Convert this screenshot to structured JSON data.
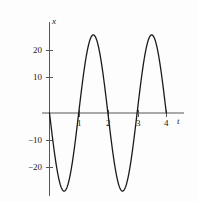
{
  "figure": {
    "background_color": "#fdfdfd",
    "curve_color": "#1a1a1a",
    "axis_color": "#4d4d4d"
  },
  "axes": {
    "x_axis_name": "t",
    "y_axis_name": "x"
  },
  "chart_data": {
    "type": "line",
    "title": "",
    "xlabel": "t",
    "ylabel": "x",
    "xlim": [
      -0.15,
      4.45
    ],
    "ylim": [
      -28,
      30
    ],
    "grid": false,
    "legend": null,
    "x_ticks": [
      1,
      2,
      3,
      4
    ],
    "x_tick_labels": [
      "1",
      "2",
      "3",
      "4"
    ],
    "y_ticks": [
      20,
      10,
      -10,
      -20
    ],
    "y_tick_labels": [
      "20",
      "10",
      "−10",
      "−20"
    ],
    "series": [
      {
        "name": "x(t)",
        "description": "sinusoid, amplitude 25, period 2, starts at origin descending",
        "amplitude": 25,
        "period": 2,
        "phase": "negative-sine",
        "domain": [
          0,
          4
        ],
        "x": [
          0,
          0.1,
          0.2,
          0.3,
          0.4,
          0.5,
          0.6,
          0.7,
          0.8,
          0.9,
          1.0,
          1.1,
          1.2,
          1.3,
          1.4,
          1.5,
          1.6,
          1.7,
          1.8,
          1.9,
          2.0,
          2.1,
          2.2,
          2.3,
          2.4,
          2.5,
          2.6,
          2.7,
          2.8,
          2.9,
          3.0,
          3.1,
          3.2,
          3.3,
          3.4,
          3.5,
          3.6,
          3.7,
          3.8,
          3.9,
          4.0
        ],
        "values": [
          0,
          -7.7,
          -14.7,
          -20.2,
          -23.8,
          -25,
          -23.8,
          -20.2,
          -14.7,
          -7.7,
          0,
          7.7,
          14.7,
          20.2,
          23.8,
          25,
          23.8,
          20.2,
          14.7,
          7.7,
          0,
          -7.7,
          -14.7,
          -20.2,
          -23.8,
          -25,
          -23.8,
          -20.2,
          -14.7,
          -7.7,
          0,
          7.7,
          14.7,
          20.2,
          23.8,
          25,
          23.8,
          20.2,
          14.7,
          7.7,
          0
        ],
        "maxima": [
          {
            "t": 1.5,
            "x": 25
          },
          {
            "t": 3.5,
            "x": 25
          }
        ],
        "minima": [
          {
            "t": 0.5,
            "x": -25
          },
          {
            "t": 2.5,
            "x": -25
          }
        ],
        "zeros": [
          0,
          1,
          2,
          3,
          4
        ]
      }
    ]
  }
}
